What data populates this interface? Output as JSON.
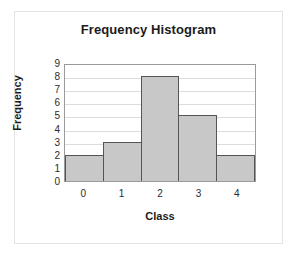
{
  "chart_data": {
    "type": "bar",
    "title": "Frequency Histogram",
    "xlabel": "Class",
    "ylabel": "Frequency",
    "categories": [
      "0",
      "1",
      "2",
      "3",
      "4"
    ],
    "values": [
      2,
      3,
      8,
      5,
      2
    ],
    "ylim": [
      0,
      9
    ],
    "y_ticks": [
      "9",
      "8",
      "7",
      "6",
      "5",
      "4",
      "3",
      "2",
      "1",
      "0"
    ],
    "grid": "horizontal",
    "legend": "none",
    "bar_fill_color": "#c8c8c8",
    "bar_border_color": "#555555",
    "plot_border_color": "#9a9a9a",
    "gridline_color": "#dcdcdc",
    "frame_color": "#e4e4e4",
    "background_color": "#ffffff",
    "text_color": "#1b1b1b"
  }
}
